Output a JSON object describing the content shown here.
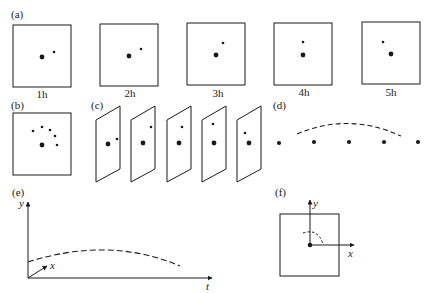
{
  "panels": {
    "a": {
      "label": "(a)",
      "frames": [
        {
          "caption": "1h"
        },
        {
          "caption": "2h"
        },
        {
          "caption": "3h"
        },
        {
          "caption": "4h"
        },
        {
          "caption": "5h"
        }
      ]
    },
    "b": {
      "label": "(b)"
    },
    "c": {
      "label": "(c)"
    },
    "d": {
      "label": "(d)"
    },
    "e": {
      "label": "(e)",
      "y_axis": "y",
      "x_axis": "x",
      "t_axis": "t"
    },
    "f": {
      "label": "(f)",
      "y_axis": "y",
      "x_axis": "x"
    }
  },
  "colors": {
    "ink": "#1a1a1a",
    "background": "#ffffff"
  }
}
